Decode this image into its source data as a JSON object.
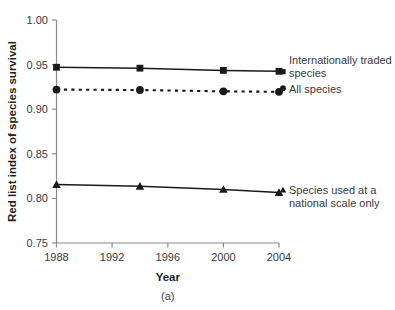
{
  "chart_data": {
    "type": "line",
    "title": "",
    "subtitle": "",
    "panel_caption": "(a)",
    "xlabel": "Year",
    "ylabel": "Red list index of species survival",
    "x": [
      1988,
      1994,
      2000,
      2004
    ],
    "xlim": [
      1988,
      2004
    ],
    "ylim": [
      0.75,
      1.0
    ],
    "xticks": [
      1988,
      1992,
      1996,
      2000,
      2004
    ],
    "xticklabels": [
      "1988",
      "1992",
      "1996",
      "2000",
      "2004"
    ],
    "yticks": [
      0.75,
      0.8,
      0.85,
      0.9,
      0.95,
      1.0
    ],
    "yticklabels": [
      "0.75",
      "0.80",
      "0.85",
      "0.90",
      "0.95",
      "1.00"
    ],
    "grid": false,
    "legend_position": "right-inline",
    "series": [
      {
        "name": "Internationally traded species",
        "marker": "square",
        "linestyle": "solid",
        "color": "#1a1a1a",
        "values": [
          0.947,
          0.946,
          0.9435,
          0.9425
        ]
      },
      {
        "name": "All species",
        "marker": "circle",
        "linestyle": "dashed",
        "color": "#1a1a1a",
        "values": [
          0.922,
          0.9215,
          0.92,
          0.9195
        ]
      },
      {
        "name": "Species used at a national scale only",
        "marker": "triangle",
        "linestyle": "solid",
        "color": "#1a1a1a",
        "values": [
          0.8155,
          0.8135,
          0.81,
          0.8065
        ]
      }
    ],
    "legend_entries": [
      {
        "label_line1": "Internationally traded",
        "label_line2": "species",
        "marker": "square"
      },
      {
        "label_line1": "All species",
        "label_line2": "",
        "marker": "circle"
      },
      {
        "label_line1": "Species used at a",
        "label_line2": "national scale only",
        "marker": "triangle"
      }
    ]
  },
  "axis": {
    "y_tick_0": "0.75",
    "y_tick_1": "0.80",
    "y_tick_2": "0.85",
    "y_tick_3": "0.90",
    "y_tick_4": "0.95",
    "y_tick_5": "1.00",
    "x_tick_0": "1988",
    "x_tick_1": "1992",
    "x_tick_2": "1996",
    "x_tick_3": "2000",
    "x_tick_4": "2004",
    "x_title": "Year",
    "y_title": "Red list index of species survival"
  },
  "legend": {
    "item0_line1": "Internationally traded",
    "item0_line2": "species",
    "item1_line1": "All species",
    "item2_line1": "Species used at a",
    "item2_line2": "national scale only"
  },
  "caption": {
    "panel": "(a)"
  },
  "colors": {
    "ink": "#1a1a1a",
    "axis": "#8a8a8a",
    "text": "#3b3b3b",
    "background": "#ffffff"
  }
}
